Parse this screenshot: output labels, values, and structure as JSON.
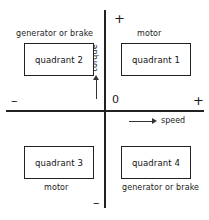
{
  "diagram": {
    "axes": {
      "vertical_label": "torque",
      "horizontal_label": "speed",
      "origin_label": "0",
      "sign_top": "+",
      "sign_right": "+",
      "sign_left": "–",
      "sign_bottom": "–",
      "axis_color": "#222222"
    },
    "quadrants": [
      {
        "id": "quadrant-1",
        "box_label": "quadrant 1",
        "caption": "motor",
        "caption_position": "above",
        "torque_sign": "+",
        "speed_sign": "+"
      },
      {
        "id": "quadrant-2",
        "box_label": "quadrant 2",
        "caption": "generator or brake",
        "caption_position": "above",
        "torque_sign": "+",
        "speed_sign": "–"
      },
      {
        "id": "quadrant-3",
        "box_label": "quadrant 3",
        "caption": "motor",
        "caption_position": "below",
        "torque_sign": "–",
        "speed_sign": "–"
      },
      {
        "id": "quadrant-4",
        "box_label": "quadrant 4",
        "caption": "generator or brake",
        "caption_position": "below",
        "torque_sign": "–",
        "speed_sign": "+"
      }
    ],
    "icons": {
      "torque_arrow": "arrow-up-icon",
      "speed_arrow": "arrow-right-icon"
    }
  }
}
